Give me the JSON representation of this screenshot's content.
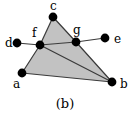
{
  "figure": {
    "caption": "(b)",
    "background_color": "#ffffff",
    "fill_color": "#c2c2c2",
    "edge_color": "#3a3a3a",
    "node_color": "#000000",
    "node_radius": 4.4,
    "width": 130,
    "height": 119
  },
  "nodes": [
    {
      "id": "a",
      "label": "a",
      "x": 22,
      "y": 73,
      "label_x": 13,
      "label_y": 88
    },
    {
      "id": "b",
      "label": "b",
      "x": 112,
      "y": 82,
      "label_x": 120,
      "label_y": 88
    },
    {
      "id": "c",
      "label": "c",
      "x": 53,
      "y": 17,
      "label_x": 50,
      "label_y": 10
    },
    {
      "id": "d",
      "label": "d",
      "x": 17,
      "y": 43,
      "label_x": 5,
      "label_y": 47
    },
    {
      "id": "e",
      "label": "e",
      "x": 105,
      "y": 38,
      "label_x": 114,
      "label_y": 43
    },
    {
      "id": "f",
      "label": "f",
      "x": 40,
      "y": 45,
      "label_x": 32,
      "label_y": 37
    },
    {
      "id": "g",
      "label": "g",
      "x": 76,
      "y": 42,
      "label_x": 73,
      "label_y": 34
    }
  ],
  "edges": [
    {
      "from": "d",
      "to": "f"
    },
    {
      "from": "f",
      "to": "c"
    },
    {
      "from": "c",
      "to": "g"
    },
    {
      "from": "f",
      "to": "g"
    },
    {
      "from": "g",
      "to": "e"
    },
    {
      "from": "g",
      "to": "b"
    },
    {
      "from": "f",
      "to": "b"
    },
    {
      "from": "f",
      "to": "a"
    },
    {
      "from": "a",
      "to": "b"
    }
  ],
  "faces": [
    {
      "id": "triangle-c-f-g",
      "vertices": [
        "c",
        "f",
        "g"
      ]
    },
    {
      "id": "quad-f-g-b-a",
      "vertices": [
        "f",
        "g",
        "b",
        "a"
      ]
    }
  ],
  "chart_data": {
    "type": "diagram",
    "title": "(b)",
    "vertices": [
      "a",
      "b",
      "c",
      "d",
      "e",
      "f",
      "g"
    ],
    "vertex_positions": {
      "a": [
        22,
        73
      ],
      "b": [
        112,
        82
      ],
      "c": [
        53,
        17
      ],
      "d": [
        17,
        43
      ],
      "e": [
        105,
        38
      ],
      "f": [
        40,
        45
      ],
      "g": [
        76,
        42
      ]
    },
    "edge_list": [
      [
        "d",
        "f"
      ],
      [
        "f",
        "c"
      ],
      [
        "c",
        "g"
      ],
      [
        "f",
        "g"
      ],
      [
        "g",
        "e"
      ],
      [
        "g",
        "b"
      ],
      [
        "f",
        "b"
      ],
      [
        "f",
        "a"
      ],
      [
        "a",
        "b"
      ]
    ],
    "shaded_faces": [
      [
        "c",
        "f",
        "g"
      ],
      [
        "f",
        "g",
        "b",
        "a"
      ]
    ]
  }
}
